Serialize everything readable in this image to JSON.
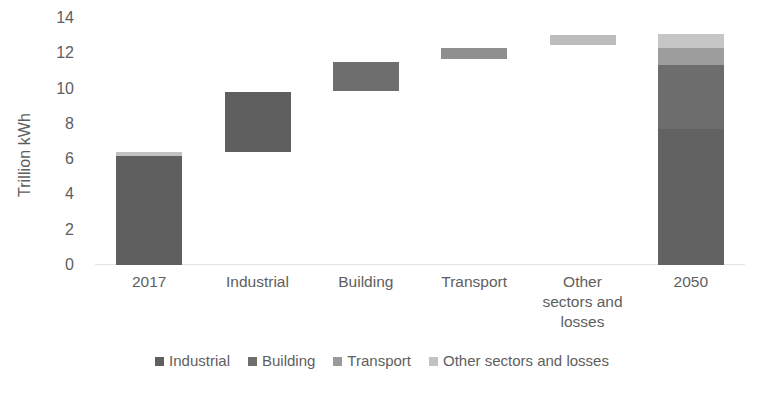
{
  "chart_data": {
    "type": "bar",
    "subtype": "waterfall-stacked",
    "title": "",
    "xlabel": "",
    "ylabel": "Trillion kWh",
    "ylim": [
      0,
      14
    ],
    "ytick_step": 2,
    "yticks": [
      "14",
      "12",
      "10",
      "8",
      "6",
      "4",
      "2",
      "0"
    ],
    "grid": false,
    "legend_position": "bottom",
    "categories": [
      "2017",
      "Industrial",
      "Building",
      "Transport",
      "Other sectors and losses",
      "2050"
    ],
    "category_labels": [
      {
        "lines": [
          "2017"
        ]
      },
      {
        "lines": [
          "Industrial"
        ]
      },
      {
        "lines": [
          "Building"
        ]
      },
      {
        "lines": [
          "Transport"
        ]
      },
      {
        "lines": [
          "Other",
          "sectors and",
          "losses"
        ]
      },
      {
        "lines": [
          "2050"
        ]
      }
    ],
    "series": [
      {
        "name": "Industrial",
        "color": "#5f5f5f"
      },
      {
        "name": "Building",
        "color": "#717171"
      },
      {
        "name": "Transport",
        "color": "#9a9a9a"
      },
      {
        "name": "Other sectors and losses",
        "color": "#c2c2c2"
      }
    ],
    "bars": [
      {
        "category": "2017",
        "base": 0,
        "top": 6.4,
        "segments": [
          {
            "series": "Industrial",
            "from": 0,
            "to": 6.2,
            "color": "#5f5f5f"
          },
          {
            "series": "Other sectors and losses",
            "from": 6.2,
            "to": 6.4,
            "color": "#c2c2c2"
          }
        ]
      },
      {
        "category": "Industrial",
        "base": 6.4,
        "top": 9.8,
        "segments": [
          {
            "series": "Industrial",
            "from": 6.4,
            "to": 9.8,
            "color": "#5f5f5f"
          }
        ]
      },
      {
        "category": "Building",
        "base": 9.85,
        "top": 11.5,
        "segments": [
          {
            "series": "Building",
            "from": 9.85,
            "to": 11.5,
            "color": "#6e6e6e"
          }
        ]
      },
      {
        "category": "Transport",
        "base": 11.65,
        "top": 12.3,
        "segments": [
          {
            "series": "Transport",
            "from": 11.65,
            "to": 12.3,
            "color": "#8f8f8f"
          }
        ]
      },
      {
        "category": "Other sectors and losses",
        "base": 12.45,
        "top": 13.05,
        "segments": [
          {
            "series": "Other sectors and losses",
            "from": 12.45,
            "to": 13.05,
            "color": "#bdbdbd"
          }
        ]
      },
      {
        "category": "2050",
        "base": 0,
        "top": 13.1,
        "segments": [
          {
            "series": "Industrial",
            "from": 0,
            "to": 7.7,
            "color": "#626262"
          },
          {
            "series": "Building",
            "from": 7.7,
            "to": 11.35,
            "color": "#6d6d6d"
          },
          {
            "series": "Transport",
            "from": 11.35,
            "to": 12.3,
            "color": "#9d9d9d"
          },
          {
            "series": "Other sectors and losses",
            "from": 12.3,
            "to": 13.1,
            "color": "#c6c6c6"
          }
        ]
      }
    ],
    "legend": [
      {
        "label": "Industrial",
        "color": "#5f5f5f"
      },
      {
        "label": "Building",
        "color": "#6e6e6e"
      },
      {
        "label": "Transport",
        "color": "#9a9a9a"
      },
      {
        "label": "Other sectors and losses",
        "color": "#c2c2c2"
      }
    ],
    "axis_color": "#e2e2e2",
    "text_color": "#5e5e5e"
  }
}
